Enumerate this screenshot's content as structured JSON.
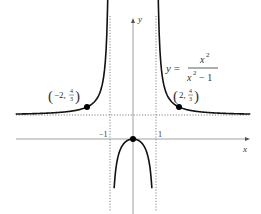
{
  "chart_data": {
    "type": "line",
    "title": "",
    "function_label": {
      "lhs": "y =",
      "numerator": "x",
      "numerator_exp": "2",
      "denominator": "x",
      "denominator_exp": "2",
      "denominator_tail": "− 1"
    },
    "xlabel": "x",
    "ylabel": "y",
    "xlim": [
      -5.1,
      5.1
    ],
    "ylim": [
      -3.0,
      5.2
    ],
    "x_ticks": [
      {
        "value": -1,
        "label": "−1"
      },
      {
        "value": 1,
        "label": "1"
      }
    ],
    "asymptotes": {
      "vertical": [
        -1,
        1
      ],
      "horizontal": [
        1
      ]
    },
    "series": [
      {
        "name": "left-branch",
        "x_range": [
          -5.1,
          -1.07
        ]
      },
      {
        "name": "middle-branch",
        "x_range": [
          -0.82,
          0.82
        ]
      },
      {
        "name": "right-branch",
        "x_range": [
          1.07,
          5.1
        ]
      }
    ],
    "points": [
      {
        "x": -2,
        "y": 1.3333,
        "label_main": "−2,",
        "label_num": "4",
        "label_den": "3"
      },
      {
        "x": 0,
        "y": 0,
        "label_main": "",
        "label_num": "",
        "label_den": ""
      },
      {
        "x": 2,
        "y": 1.3333,
        "label_main": "2,",
        "label_num": "4",
        "label_den": "3"
      }
    ],
    "grid": false,
    "colors": {
      "curve": "#111111",
      "axis": "#888888",
      "asymptote": "#777777"
    }
  }
}
